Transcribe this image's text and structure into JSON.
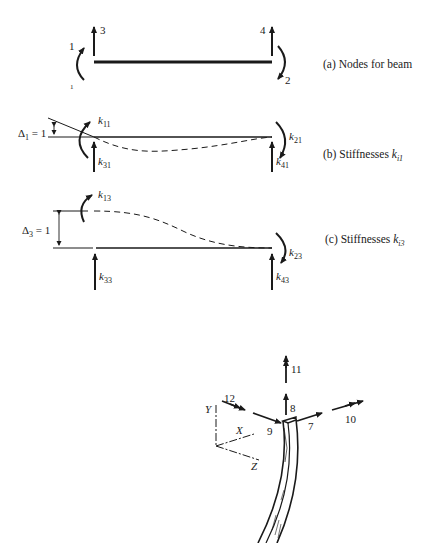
{
  "panel_a": {
    "caption": "(a) Nodes for beam",
    "node_labels": {
      "rot_left": "1",
      "rot_right": "2",
      "vert_left": "3",
      "vert_right": "4",
      "stray": "1"
    }
  },
  "panel_b": {
    "caption_prefix": "(b) Stiffnesses ",
    "caption_k": "k",
    "caption_sub": "i1",
    "delta_label": "Δ",
    "delta_sub": "1",
    "delta_value": " = 1",
    "k_labels": [
      {
        "k": "k",
        "sub": "11"
      },
      {
        "k": "k",
        "sub": "21"
      },
      {
        "k": "k",
        "sub": "31"
      },
      {
        "k": "k",
        "sub": "41"
      }
    ]
  },
  "panel_c": {
    "caption_prefix": "(c) Stiffnesses ",
    "caption_k": "k",
    "caption_sub": "i3",
    "delta_label": "Δ",
    "delta_sub": "3",
    "delta_value": " = 1",
    "k_labels": [
      {
        "k": "k",
        "sub": "13"
      },
      {
        "k": "k",
        "sub": "23"
      },
      {
        "k": "k",
        "sub": "33"
      },
      {
        "k": "k",
        "sub": "43"
      }
    ]
  },
  "panel_3d": {
    "dof_labels": [
      "7",
      "8",
      "9",
      "10",
      "11",
      "12"
    ],
    "axis_labels": {
      "x": "X",
      "y": "Y",
      "z": "Z"
    }
  }
}
